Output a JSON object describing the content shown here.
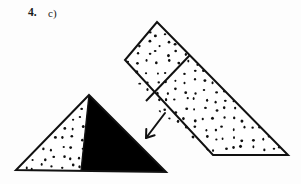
{
  "figure": {
    "problem_number": "4.",
    "part_label": "c)",
    "ink_color": "#111111",
    "fill_color": "#000000",
    "paper_color": "#fdfdfd",
    "stipple_color": "#101010",
    "shapes": {
      "upper_solid": {
        "name": "tilted-prism-net",
        "outline": "157,22 288,155 213,155 125,60",
        "divider": "190,55 146,101",
        "stippled": true,
        "description": "elongated tilted quadrilateral divided into a rhombus face and a long triangular face, both stippled"
      },
      "lower_triangle": {
        "name": "stippled-black-triangle",
        "outline": "89,95 166,172 16,170",
        "divider": "89,95 81,171",
        "left_region_fill": "stipple",
        "right_region_fill": "solid-black",
        "description": "triangle whose left portion is stippled and right portion is filled solid black"
      },
      "arrow": {
        "name": "direction-arrow",
        "from": "165,113",
        "to": "146,138",
        "head_size": 9,
        "description": "arrow pointing down and to the left, from the upper shape toward the lower triangle"
      }
    },
    "stipple": {
      "dot_radius": 1.15,
      "spacing": 9.5,
      "jitter": 2.6
    }
  }
}
